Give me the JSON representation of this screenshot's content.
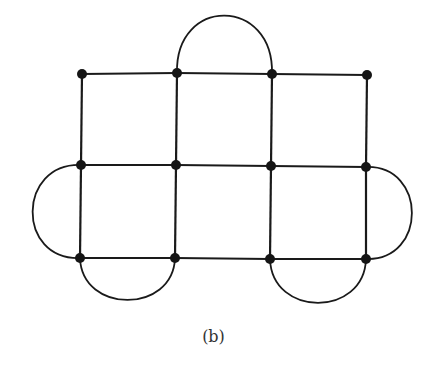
{
  "caption": "(b)",
  "colors": {
    "stroke": "#1a1a1a",
    "node": "#151515",
    "background": "#ffffff"
  },
  "nodes": [
    {
      "id": "r1c1",
      "x": 82,
      "y": 74
    },
    {
      "id": "r1c2",
      "x": 177,
      "y": 73
    },
    {
      "id": "r1c3",
      "x": 272,
      "y": 74
    },
    {
      "id": "r1c4",
      "x": 367,
      "y": 75
    },
    {
      "id": "r2c1",
      "x": 81,
      "y": 165
    },
    {
      "id": "r2c2",
      "x": 176,
      "y": 165
    },
    {
      "id": "r2c3",
      "x": 271,
      "y": 166
    },
    {
      "id": "r2c4",
      "x": 366,
      "y": 167
    },
    {
      "id": "r3c1",
      "x": 80,
      "y": 258
    },
    {
      "id": "r3c2",
      "x": 175,
      "y": 258
    },
    {
      "id": "r3c3",
      "x": 270,
      "y": 259
    },
    {
      "id": "r3c4",
      "x": 366,
      "y": 259
    }
  ],
  "edges": [
    [
      "r1c1",
      "r1c2"
    ],
    [
      "r1c2",
      "r1c3"
    ],
    [
      "r1c3",
      "r1c4"
    ],
    [
      "r2c1",
      "r2c2"
    ],
    [
      "r2c2",
      "r2c3"
    ],
    [
      "r2c3",
      "r2c4"
    ],
    [
      "r3c1",
      "r3c2"
    ],
    [
      "r3c2",
      "r3c3"
    ],
    [
      "r3c3",
      "r3c4"
    ],
    [
      "r1c1",
      "r2c1"
    ],
    [
      "r2c1",
      "r3c1"
    ],
    [
      "r1c2",
      "r2c2"
    ],
    [
      "r2c2",
      "r3c2"
    ],
    [
      "r1c3",
      "r2c3"
    ],
    [
      "r2c3",
      "r3c3"
    ],
    [
      "r1c4",
      "r2c4"
    ],
    [
      "r2c4",
      "r3c4"
    ]
  ],
  "arcs": [
    {
      "from": "r1c2",
      "to": "r1c3",
      "side": "top",
      "bulge": 58
    },
    {
      "from": "r2c1",
      "to": "r3c1",
      "side": "left",
      "bulge": 48
    },
    {
      "from": "r2c4",
      "to": "r3c4",
      "side": "right",
      "bulge": 46
    },
    {
      "from": "r3c1",
      "to": "r3c2",
      "side": "bottom",
      "bulge": 42
    },
    {
      "from": "r3c3",
      "to": "r3c4",
      "side": "bottom",
      "bulge": 44
    }
  ]
}
